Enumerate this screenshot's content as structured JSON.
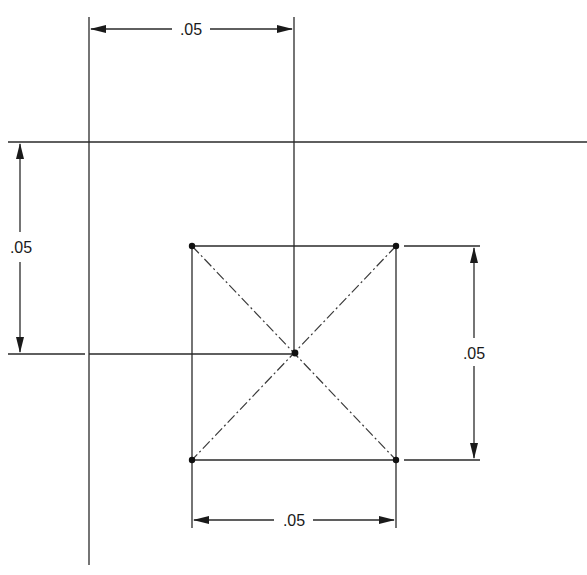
{
  "diagram": {
    "type": "engineering-dimension-drawing",
    "colors": {
      "line": "#2a2a2a",
      "text": "#1a1a1a",
      "background": "#ffffff"
    },
    "dimensions": {
      "top_horizontal": {
        "label": ".05"
      },
      "left_vertical": {
        "label": ".05"
      },
      "right_vertical": {
        "label": ".05"
      },
      "bottom_horizontal": {
        "label": ".05"
      }
    },
    "square": {
      "corners": [
        "top-left",
        "top-right",
        "bottom-left",
        "bottom-right"
      ],
      "center_point": "diagonal-intersection"
    }
  }
}
